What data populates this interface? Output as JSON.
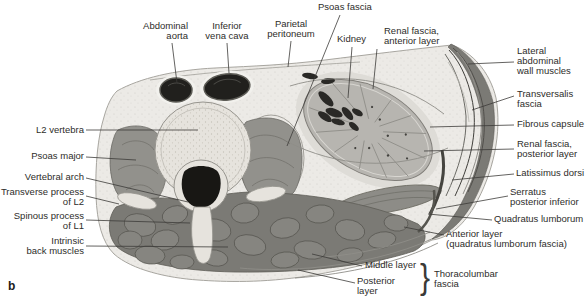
{
  "figure": {
    "panel_letter": "b",
    "type": "anatomical cross-section diagram, transverse section of abdomen at L2 level showing kidney and thoracolumbar fascia"
  },
  "colors": {
    "background": "#ffffff",
    "label_text": "#2e2d2a",
    "leader_line": "#3c3b38",
    "body_tissue": "#eceae6",
    "muscle_mid": "#8f8e89",
    "muscle_dark": "#7b7a75",
    "bone": "#e6e3dd",
    "kidney": "#b7b5b0",
    "vessel_dark": "#21201d"
  },
  "labels": {
    "abdominal_aorta": "Abdominal\naorta",
    "inferior_vena_cava": "Inferior\nvena cava",
    "parietal_peritoneum": "Parietal\nperitoneum",
    "psoas_fascia": "Psoas fascia",
    "kidney": "Kidney",
    "renal_fascia_anterior": "Renal fascia,\nanterior layer",
    "lateral_abdominal_wall_muscles": "Lateral\nabdominal\nwall muscles",
    "transversalis_fascia": "Transversalis\nfascia",
    "fibrous_capsule": "Fibrous capsule",
    "renal_fascia_posterior": "Renal fascia,\nposterior layer",
    "latissimus_dorsi": "Latissimus dorsi",
    "serratus_posterior_inferior": "Serratus\nposterior inferior",
    "quadratus_lumborum": "Quadratus lumborum",
    "anterior_layer_ql": "Anterior layer\n(quadratus lumborum fascia)",
    "middle_layer": "Middle layer",
    "posterior_layer": "Posterior\nlayer",
    "thoracolumbar_fascia": "Thoracolumbar\nfascia",
    "l2_vertebra": "L2 vertebra",
    "psoas_major": "Psoas major",
    "vertebral_arch": "Vertebral arch",
    "transverse_process_l2": "Transverse process\nof L2",
    "spinous_process_l1": "Spinous process\nof L1",
    "intrinsic_back_muscles": "Intrinsic\nback muscles",
    "brace": "}"
  }
}
